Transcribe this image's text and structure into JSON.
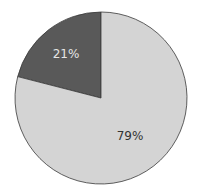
{
  "chart_data": {
    "type": "pie",
    "title": "",
    "categories": [
      "Dark segment",
      "Light segment"
    ],
    "values": [
      21,
      79
    ],
    "labels": [
      "21%",
      "79%"
    ],
    "colors": [
      "#595959",
      "#d4d4d4"
    ],
    "label_colors": [
      "#e6e6e6",
      "#333333"
    ],
    "start_angle_deg": 90,
    "direction": "counterclockwise",
    "legend": "none"
  }
}
